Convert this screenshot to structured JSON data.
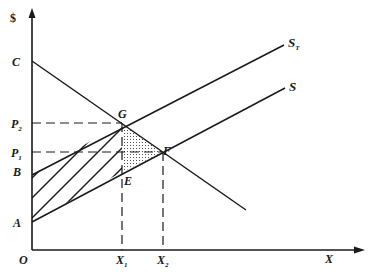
{
  "diagram": {
    "axes": {
      "y_label": "$",
      "x_label": "X",
      "origin_label": "O"
    },
    "price_labels": {
      "C": "C",
      "P2": "P",
      "P2_sub": "2",
      "P1": "P",
      "P1_sub": "1",
      "B": "B",
      "A": "A"
    },
    "quantity_labels": {
      "X1": "X",
      "X1_sub": "1",
      "X2": "X",
      "X2_sub": "2"
    },
    "points": {
      "G": "G",
      "F": "F",
      "E": "E"
    },
    "curves": {
      "ST": "S",
      "ST_sub": "T",
      "S": "S"
    }
  }
}
